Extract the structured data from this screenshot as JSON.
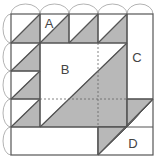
{
  "diagram": {
    "labels": {
      "a": "A",
      "b": "B",
      "c": "C",
      "d": "D"
    },
    "colors": {
      "fill_shaded": "#b8b8b8",
      "fill_light": "#ffffff",
      "stroke": "#555555",
      "arc": "#9a9a9a"
    }
  }
}
